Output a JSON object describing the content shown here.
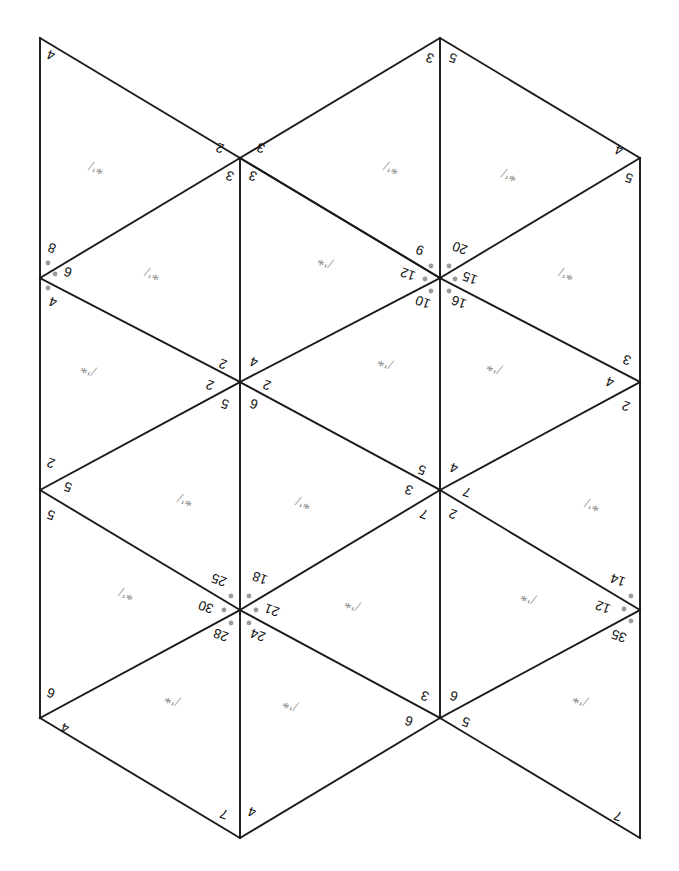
{
  "figure": {
    "background_color": "#ffffff",
    "edge_color": "#1a1a1a",
    "label_color": "#111111",
    "mark_color": "#8b8b8b",
    "dot_color": "#9a9a9a",
    "width": 679,
    "height": 871
  },
  "geometry": {
    "columns_x": [
      40,
      240,
      440,
      640
    ],
    "rows_y": [
      38,
      158,
      278,
      382,
      490,
      610,
      718,
      838
    ],
    "note": "isometric triangular lattice"
  },
  "vertex_labels": [
    {
      "id": "v-top-left",
      "x": 40,
      "y": 38,
      "items": [
        {
          "text": "4",
          "dx": 11,
          "dy": 17,
          "rot": 200
        }
      ]
    },
    {
      "id": "v-top-mid",
      "x": 240,
      "y": 158,
      "items": [
        {
          "text": "2",
          "dx": -20,
          "dy": -10,
          "rot": 200
        },
        {
          "text": "3",
          "dx": 21,
          "dy": -10,
          "rot": 200
        },
        {
          "text": "3",
          "dx": -10,
          "dy": 18,
          "rot": 200
        },
        {
          "text": "3",
          "dx": 13,
          "dy": 18,
          "rot": 200
        }
      ]
    },
    {
      "id": "v-top-right-mid",
      "x": 440,
      "y": 38,
      "items": [
        {
          "text": "3",
          "dx": -10,
          "dy": 20,
          "rot": 200
        },
        {
          "text": "5",
          "dx": 13,
          "dy": 20,
          "rot": 200
        }
      ]
    },
    {
      "id": "v-top-right",
      "x": 640,
      "y": 158,
      "items": [
        {
          "text": "4",
          "dx": -21,
          "dy": -8,
          "rot": 200
        },
        {
          "text": "5",
          "dx": -11,
          "dy": 20,
          "rot": 200
        }
      ]
    },
    {
      "id": "v-left-upper",
      "x": 40,
      "y": 278,
      "items": [
        {
          "text": "8",
          "dx": 12,
          "dy": -30,
          "rot": 200
        },
        {
          "text": "6",
          "dx": 28,
          "dy": -6,
          "rot": 200
        },
        {
          "text": "4",
          "dx": 13,
          "dy": 24,
          "rot": 200
        }
      ],
      "dots": [
        {
          "dx": 8,
          "dy": -15
        },
        {
          "dx": 15,
          "dy": -4
        },
        {
          "dx": 8,
          "dy": 10
        }
      ]
    },
    {
      "id": "v-center-upper",
      "x": 440,
      "y": 278,
      "items": [
        {
          "text": "9",
          "dx": -20,
          "dy": -28,
          "rot": 200
        },
        {
          "text": "20",
          "dx": 20,
          "dy": -30,
          "rot": 200
        },
        {
          "text": "12",
          "dx": -32,
          "dy": -4,
          "rot": 200
        },
        {
          "text": "15",
          "dx": 30,
          "dy": 0,
          "rot": 200
        },
        {
          "text": "10",
          "dx": -17,
          "dy": 24,
          "rot": 200
        },
        {
          "text": "16",
          "dx": 19,
          "dy": 24,
          "rot": 200
        }
      ],
      "dots": [
        {
          "dx": -9,
          "dy": -12
        },
        {
          "dx": 9,
          "dy": -12
        },
        {
          "dx": -15,
          "dy": 1
        },
        {
          "dx": 15,
          "dy": 1
        },
        {
          "dx": -9,
          "dy": 13
        },
        {
          "dx": 9,
          "dy": 13
        }
      ]
    },
    {
      "id": "v-mid-center",
      "x": 240,
      "y": 382,
      "items": [
        {
          "text": "2",
          "dx": -17,
          "dy": -18,
          "rot": 200
        },
        {
          "text": "4",
          "dx": 14,
          "dy": -20,
          "rot": 200
        },
        {
          "text": "2",
          "dx": -30,
          "dy": 3,
          "rot": 200
        },
        {
          "text": "2",
          "dx": 27,
          "dy": 3,
          "rot": 200
        },
        {
          "text": "5",
          "dx": -15,
          "dy": 22,
          "rot": 200
        },
        {
          "text": "6",
          "dx": 14,
          "dy": 22,
          "rot": 200
        }
      ]
    },
    {
      "id": "v-right-mid",
      "x": 640,
      "y": 382,
      "items": [
        {
          "text": "3",
          "dx": -13,
          "dy": -22,
          "rot": 200
        },
        {
          "text": "4",
          "dx": -30,
          "dy": 0,
          "rot": 200
        },
        {
          "text": "2",
          "dx": -14,
          "dy": 24,
          "rot": 200
        }
      ]
    },
    {
      "id": "v-left-lower",
      "x": 40,
      "y": 490,
      "items": [
        {
          "text": "2",
          "dx": 11,
          "dy": -27,
          "rot": 200
        },
        {
          "text": "5",
          "dx": 28,
          "dy": -3,
          "rot": 200
        },
        {
          "text": "5",
          "dx": 11,
          "dy": 25,
          "rot": 200
        }
      ]
    },
    {
      "id": "v-center-lower",
      "x": 440,
      "y": 490,
      "items": [
        {
          "text": "5",
          "dx": -18,
          "dy": -20,
          "rot": 200
        },
        {
          "text": "4",
          "dx": 14,
          "dy": -22,
          "rot": 200
        },
        {
          "text": "3",
          "dx": -31,
          "dy": 0,
          "rot": 200
        },
        {
          "text": "7",
          "dx": 27,
          "dy": 2,
          "rot": 200
        },
        {
          "text": "7",
          "dx": -16,
          "dy": 24,
          "rot": 200
        },
        {
          "text": "2",
          "dx": 13,
          "dy": 24,
          "rot": 200
        }
      ]
    },
    {
      "id": "v-hub-lower",
      "x": 240,
      "y": 610,
      "items": [
        {
          "text": "25",
          "dx": -21,
          "dy": -30,
          "rot": 200
        },
        {
          "text": "18",
          "dx": 20,
          "dy": -32,
          "rot": 200
        },
        {
          "text": "30",
          "dx": -34,
          "dy": -3,
          "rot": 200
        },
        {
          "text": "21",
          "dx": 32,
          "dy": 0,
          "rot": 200
        },
        {
          "text": "28",
          "dx": -19,
          "dy": 25,
          "rot": 200
        },
        {
          "text": "24",
          "dx": 18,
          "dy": 25,
          "rot": 200
        }
      ],
      "dots": [
        {
          "dx": -9,
          "dy": -14
        },
        {
          "dx": 9,
          "dy": -14
        },
        {
          "dx": -16,
          "dy": 0
        },
        {
          "dx": 16,
          "dy": 0
        },
        {
          "dx": -9,
          "dy": 13
        },
        {
          "dx": 9,
          "dy": 13
        }
      ]
    },
    {
      "id": "v-right-lower",
      "x": 640,
      "y": 610,
      "items": [
        {
          "text": "14",
          "dx": -22,
          "dy": -30,
          "rot": 200
        },
        {
          "text": "12",
          "dx": -37,
          "dy": -3,
          "rot": 200
        },
        {
          "text": "35",
          "dx": -21,
          "dy": 26,
          "rot": 200
        }
      ],
      "dots": [
        {
          "dx": -9,
          "dy": -14
        },
        {
          "dx": -16,
          "dy": -1
        },
        {
          "dx": -9,
          "dy": 11
        }
      ]
    },
    {
      "id": "v-bottom-left",
      "x": 40,
      "y": 718,
      "items": [
        {
          "text": "6",
          "dx": 11,
          "dy": -25,
          "rot": 200
        },
        {
          "text": "4",
          "dx": 25,
          "dy": 10,
          "rot": 200
        }
      ]
    },
    {
      "id": "v-bottom-center",
      "x": 440,
      "y": 718,
      "items": [
        {
          "text": "3",
          "dx": -15,
          "dy": -22,
          "rot": 200
        },
        {
          "text": "6",
          "dx": 14,
          "dy": -22,
          "rot": 200
        },
        {
          "text": "6",
          "dx": -31,
          "dy": 3,
          "rot": 200
        },
        {
          "text": "5",
          "dx": 26,
          "dy": 4,
          "rot": 200
        }
      ]
    },
    {
      "id": "v-bot-left-tip",
      "x": 240,
      "y": 838,
      "items": [
        {
          "text": "7",
          "dx": -16,
          "dy": -24,
          "rot": 200
        },
        {
          "text": "4",
          "dx": 12,
          "dy": -26,
          "rot": 200
        }
      ]
    },
    {
      "id": "v-bot-right-tip",
      "x": 640,
      "y": 838,
      "items": [
        {
          "text": "7",
          "dx": -22,
          "dy": -22,
          "rot": 200
        }
      ]
    }
  ],
  "face_marks": [
    {
      "id": "fm-1",
      "x": 96,
      "y": 168,
      "text": "*'/",
      "rot": 200
    },
    {
      "id": "fm-2",
      "x": 391,
      "y": 168,
      "text": "*'/",
      "rot": 200
    },
    {
      "id": "fm-3",
      "x": 509,
      "y": 175,
      "text": "*'/",
      "rot": 200
    },
    {
      "id": "fm-4",
      "x": 152,
      "y": 274,
      "text": "*'/",
      "rot": 200
    },
    {
      "id": "fm-5",
      "x": 325,
      "y": 262,
      "text": "/'*",
      "rot": 200
    },
    {
      "id": "fm-6",
      "x": 566,
      "y": 274,
      "text": "*'/",
      "rot": 200
    },
    {
      "id": "fm-7",
      "x": 88,
      "y": 370,
      "text": "/'*",
      "rot": 200
    },
    {
      "id": "fm-8",
      "x": 385,
      "y": 363,
      "text": "/'*",
      "rot": 200
    },
    {
      "id": "fm-9",
      "x": 494,
      "y": 368,
      "text": "/'*",
      "rot": 200
    },
    {
      "id": "fm-10",
      "x": 185,
      "y": 500,
      "text": "*'/",
      "rot": 200
    },
    {
      "id": "fm-11",
      "x": 303,
      "y": 503,
      "text": "*'/",
      "rot": 200
    },
    {
      "id": "fm-12",
      "x": 592,
      "y": 505,
      "text": "*'/",
      "rot": 200
    },
    {
      "id": "fm-13",
      "x": 126,
      "y": 594,
      "text": "*'/",
      "rot": 200
    },
    {
      "id": "fm-14",
      "x": 352,
      "y": 605,
      "text": "/'*",
      "rot": 200
    },
    {
      "id": "fm-15",
      "x": 528,
      "y": 598,
      "text": "/'*",
      "rot": 200
    },
    {
      "id": "fm-16",
      "x": 172,
      "y": 700,
      "text": "/'*",
      "rot": 200
    },
    {
      "id": "fm-17",
      "x": 290,
      "y": 705,
      "text": "/'*",
      "rot": 200
    },
    {
      "id": "fm-18",
      "x": 580,
      "y": 700,
      "text": "/'*",
      "rot": 200
    }
  ],
  "edges": [
    {
      "id": "e-left-spine",
      "x1": 40,
      "y1": 38,
      "x2": 40,
      "y2": 718
    },
    {
      "id": "e-mid-spine",
      "x1": 240,
      "y1": 158,
      "x2": 240,
      "y2": 838
    },
    {
      "id": "e-ctr-spine",
      "x1": 440,
      "y1": 38,
      "x2": 440,
      "y2": 718
    },
    {
      "id": "e-right-spine",
      "x1": 640,
      "y1": 158,
      "x2": 640,
      "y2": 838
    },
    {
      "id": "e-d1",
      "x1": 40,
      "y1": 38,
      "x2": 240,
      "y2": 158
    },
    {
      "id": "e-d2",
      "x1": 240,
      "y1": 158,
      "x2": 440,
      "y2": 278
    },
    {
      "id": "e-d3",
      "x1": 440,
      "y1": 278,
      "x2": 640,
      "y2": 158
    },
    {
      "id": "e-d4",
      "x1": 440,
      "y1": 38,
      "x2": 240,
      "y2": 158
    },
    {
      "id": "e-d5",
      "x1": 440,
      "y1": 38,
      "x2": 640,
      "y2": 158
    },
    {
      "id": "e-d6",
      "x1": 40,
      "y1": 278,
      "x2": 240,
      "y2": 158
    },
    {
      "id": "e-d7",
      "x1": 240,
      "y1": 158,
      "x2": 440,
      "y2": 278
    },
    {
      "id": "e-d8",
      "x1": 40,
      "y1": 278,
      "x2": 240,
      "y2": 382
    },
    {
      "id": "e-d9",
      "x1": 240,
      "y1": 382,
      "x2": 440,
      "y2": 278
    },
    {
      "id": "e-d10",
      "x1": 440,
      "y1": 278,
      "x2": 640,
      "y2": 382
    },
    {
      "id": "e-d11",
      "x1": 40,
      "y1": 490,
      "x2": 240,
      "y2": 382
    },
    {
      "id": "e-d12",
      "x1": 240,
      "y1": 382,
      "x2": 440,
      "y2": 490
    },
    {
      "id": "e-d13",
      "x1": 440,
      "y1": 490,
      "x2": 640,
      "y2": 382
    },
    {
      "id": "e-d14",
      "x1": 40,
      "y1": 490,
      "x2": 240,
      "y2": 610
    },
    {
      "id": "e-d15",
      "x1": 240,
      "y1": 610,
      "x2": 440,
      "y2": 490
    },
    {
      "id": "e-d16",
      "x1": 440,
      "y1": 490,
      "x2": 640,
      "y2": 610
    },
    {
      "id": "e-d17",
      "x1": 40,
      "y1": 718,
      "x2": 240,
      "y2": 610
    },
    {
      "id": "e-d18",
      "x1": 240,
      "y1": 610,
      "x2": 440,
      "y2": 718
    },
    {
      "id": "e-d19",
      "x1": 440,
      "y1": 718,
      "x2": 640,
      "y2": 610
    },
    {
      "id": "e-d20",
      "x1": 40,
      "y1": 718,
      "x2": 240,
      "y2": 838
    },
    {
      "id": "e-d21",
      "x1": 240,
      "y1": 838,
      "x2": 440,
      "y2": 718
    },
    {
      "id": "e-d22",
      "x1": 440,
      "y1": 718,
      "x2": 640,
      "y2": 838
    }
  ]
}
